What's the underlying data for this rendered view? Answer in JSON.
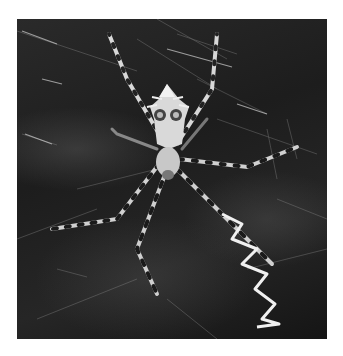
{
  "image": {
    "subject": "Orb-weaver spider (Argiope) on web with zigzag stabilimentum",
    "tone": "grayscale",
    "background_color": "#ffffff",
    "photo_bounds": {
      "x": 17,
      "y": 19,
      "width": 310,
      "height": 320
    }
  }
}
